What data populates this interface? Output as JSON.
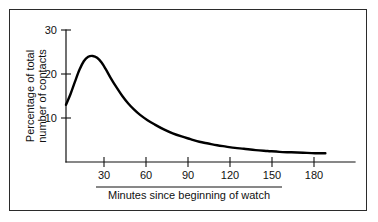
{
  "figure": {
    "frame_color": "#2b2b2b",
    "background_color": "#ffffff",
    "curve_color": "#000000",
    "axis_color": "#111111"
  },
  "axes": {
    "y_title_line1": "Percentage of total",
    "y_title_line2": "number of contacts",
    "x_title": "Minutes since beginning of watch",
    "y_ticks": [
      "10",
      "20",
      "30"
    ],
    "x_ticks": [
      "30",
      "60",
      "90",
      "120",
      "150",
      "180"
    ]
  },
  "chart_data": {
    "type": "line",
    "title": "",
    "subtitle": "",
    "xlabel": "Minutes since beginning of watch",
    "ylabel": "Percentage of total number of contacts",
    "xlim": [
      0,
      195
    ],
    "ylim": [
      0,
      31
    ],
    "xticks": [
      30,
      60,
      90,
      120,
      150,
      180
    ],
    "yticks": [
      10,
      20,
      30
    ],
    "grid": false,
    "legend": false,
    "legend_position": "none",
    "annotations": [],
    "series": [
      {
        "name": "Percentage of total number of contacts",
        "color": "#000000",
        "x": [
          0,
          3,
          6,
          9,
          12,
          15,
          18,
          21,
          24,
          27,
          30,
          34,
          38,
          42,
          46,
          50,
          55,
          60,
          66,
          72,
          78,
          84,
          90,
          96,
          102,
          108,
          114,
          120,
          128,
          136,
          144,
          152,
          160,
          168,
          175
        ],
        "y": [
          13.0,
          15.4,
          18.2,
          20.9,
          22.9,
          23.9,
          24.1,
          23.7,
          22.6,
          21.0,
          19.2,
          17.0,
          15.0,
          13.3,
          11.9,
          10.7,
          9.5,
          8.5,
          7.4,
          6.5,
          5.8,
          5.2,
          4.6,
          4.2,
          3.8,
          3.5,
          3.2,
          3.0,
          2.7,
          2.5,
          2.3,
          2.2,
          2.1,
          2.0,
          2.0
        ]
      }
    ]
  }
}
